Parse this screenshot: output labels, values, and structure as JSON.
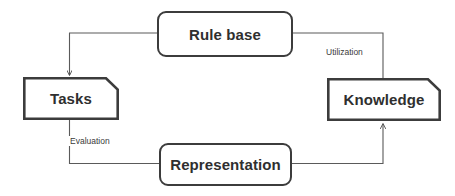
{
  "diagram": {
    "background_color": "#ffffff",
    "node_border_color": "#3c3c3c",
    "connector_color": "#5a5a5a",
    "text_color": "#2f2f2f",
    "nodes": [
      {
        "id": "rule-base",
        "label": "Rule base",
        "shape": "rounded-rectangle",
        "position": "top"
      },
      {
        "id": "tasks",
        "label": "Tasks",
        "shape": "clipped-corner-rectangle",
        "position": "left"
      },
      {
        "id": "knowledge",
        "label": "Knowledge",
        "shape": "clipped-corner-rectangle",
        "position": "right"
      },
      {
        "id": "representation",
        "label": "Representation",
        "shape": "rounded-rectangle",
        "position": "bottom"
      }
    ],
    "edges": [
      {
        "id": "rule-base-to-tasks",
        "from": "rule-base",
        "to": "tasks",
        "label": "",
        "arrow": "to-target"
      },
      {
        "id": "rule-base-to-knowledge",
        "from": "rule-base",
        "to": "knowledge",
        "label": "Utilization",
        "arrow": "none"
      },
      {
        "id": "tasks-to-representation",
        "from": "tasks",
        "to": "representation",
        "label": "Evaluation",
        "arrow": "none"
      },
      {
        "id": "representation-to-knowledge",
        "from": "representation",
        "to": "knowledge",
        "label": "",
        "arrow": "to-target"
      }
    ],
    "edge_labels": {
      "utilization": "Utilization",
      "evaluation": "Evaluation"
    }
  }
}
